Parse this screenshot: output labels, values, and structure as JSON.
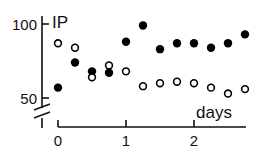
{
  "chart_data": {
    "type": "scatter",
    "title": "",
    "xlabel": "days",
    "ylabel": "IP",
    "xlim": [
      0,
      2.8
    ],
    "ylim": [
      50,
      100
    ],
    "y_axis_break": true,
    "grid": false,
    "x_ticks": [
      0,
      1,
      2
    ],
    "x_tick_labels": [
      "0",
      "1",
      "2"
    ],
    "y_ticks": [
      50,
      100
    ],
    "y_tick_labels": [
      "50",
      "100"
    ],
    "series": [
      {
        "name": "filled",
        "marker": "filled-circle",
        "color": "#000000",
        "x": [
          0,
          0.25,
          0.5,
          0.75,
          1.0,
          1.25,
          1.5,
          1.75,
          2.0,
          2.25,
          2.5,
          2.75
        ],
        "y": [
          57,
          74,
          68,
          67,
          88,
          99,
          83,
          87,
          87,
          84,
          87,
          93
        ]
      },
      {
        "name": "open",
        "marker": "open-circle",
        "color": "#000000",
        "x": [
          0,
          0.25,
          0.5,
          0.75,
          1.0,
          1.25,
          1.5,
          1.75,
          2.0,
          2.25,
          2.5,
          2.75
        ],
        "y": [
          87,
          84,
          64,
          72,
          68,
          58,
          60,
          61,
          60,
          57,
          53,
          56
        ]
      }
    ]
  }
}
